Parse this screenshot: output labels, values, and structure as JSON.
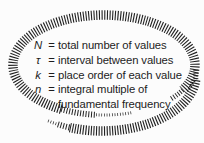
{
  "figure": {
    "rows": [
      {
        "symbol": "N",
        "eq": "=",
        "text": "total number of values"
      },
      {
        "symbol": "τ",
        "eq": "=",
        "text": "interval between values"
      },
      {
        "symbol": "k",
        "eq": "=",
        "text": "place order of each value"
      },
      {
        "symbol": "n",
        "eq": "=",
        "text": "integral multiple of",
        "text2": "fundamental frequency"
      }
    ],
    "colors": {
      "ink": "#1c1c1c",
      "hatch": "#212121",
      "bg": "#fcfcfc"
    }
  }
}
